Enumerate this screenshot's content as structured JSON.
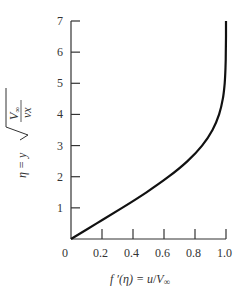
{
  "chart_data": {
    "type": "line",
    "title": "",
    "xlabel": "f ′(η) = u/V∞",
    "ylabel": "η = y √(V∞/νx)",
    "xlim": [
      0,
      1.0
    ],
    "ylim": [
      0,
      7
    ],
    "grid": false,
    "legend": null,
    "x_ticks": [
      "0",
      "0.2",
      "0.4",
      "0.6",
      "0.8",
      "1.0"
    ],
    "y_ticks": [
      "1",
      "2",
      "3",
      "4",
      "5",
      "6",
      "7"
    ],
    "series": [
      {
        "name": "Blasius velocity profile",
        "x": [
          0.0,
          0.1659,
          0.3298,
          0.4868,
          0.6298,
          0.7513,
          0.846,
          0.913,
          0.9555,
          0.9795,
          0.9915,
          0.9969,
          0.999,
          0.9997,
          0.9999,
          1.0
        ],
        "y": [
          0.0,
          0.5,
          1.0,
          1.5,
          2.0,
          2.5,
          3.0,
          3.5,
          4.0,
          4.5,
          5.0,
          5.5,
          6.0,
          6.5,
          6.8,
          7.0
        ]
      }
    ]
  },
  "labels": {
    "origin": "0",
    "x_axis_title_lhs": "f ′(η) = ",
    "x_axis_title_u": "u",
    "x_axis_title_slash": "/",
    "x_axis_title_V": "V",
    "x_axis_title_inf": "∞",
    "y_axis_eta": "η = y",
    "y_axis_num": "V∞",
    "y_axis_den": "νx"
  }
}
